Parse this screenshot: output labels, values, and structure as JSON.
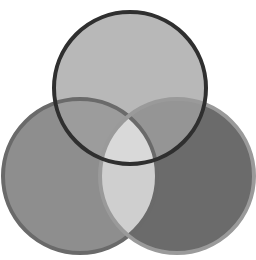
{
  "diagram": {
    "type": "venn-3",
    "circles": [
      {
        "id": "top",
        "cx": 130,
        "cy": 88,
        "r": 76,
        "fill": "#b8b8b8",
        "stroke": "#2f2f2f",
        "stroke_width": 4
      },
      {
        "id": "left",
        "cx": 80,
        "cy": 176,
        "r": 77,
        "fill": "#8e8e8e",
        "stroke": "#6a6a6a",
        "stroke_width": 4
      },
      {
        "id": "right",
        "cx": 177,
        "cy": 176,
        "r": 77,
        "fill": "#6b6b6b",
        "stroke": "#9a9a9a",
        "stroke_width": 4
      }
    ],
    "regions": {
      "top_left": "#9c9c9c",
      "top_right": "#959595",
      "left_right": "#cfcfcf",
      "all_three": "#d9d9d9"
    }
  }
}
